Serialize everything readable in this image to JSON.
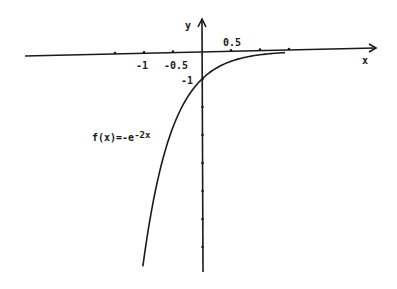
{
  "chart_data": {
    "type": "line",
    "title": "",
    "function_label": "f(x)=-e",
    "function_exponent": "-2x",
    "function_expr": "f(x) = -e^(-2x)",
    "xlabel": "x",
    "ylabel": "y",
    "x_tick_labels": [
      {
        "value": -1,
        "label": "-1"
      },
      {
        "value": -0.5,
        "label": "-0.5"
      },
      {
        "value": 0.5,
        "label": "0.5"
      }
    ],
    "x_ticks": [
      -1.5,
      -1,
      -0.5,
      0.5,
      1,
      1.5
    ],
    "y_tick_labels": [
      {
        "value": -1,
        "label": "-1"
      }
    ],
    "y_ticks": [
      -1,
      -2,
      -3,
      -4,
      -5,
      -6,
      -7
    ],
    "xlim": [
      -3,
      3
    ],
    "ylim": [
      -7.8,
      1.5
    ],
    "grid": false,
    "legend": "none",
    "series": [
      {
        "name": "f(x)=-e^(-2x)",
        "x": [
          -1.02,
          -1.0,
          -0.8,
          -0.6,
          -0.4,
          -0.2,
          0,
          0.2,
          0.4,
          0.6,
          0.8,
          1.0,
          1.2,
          1.43
        ],
        "values": [
          -7.69,
          -7.39,
          -4.95,
          -3.32,
          -2.23,
          -1.49,
          -1.0,
          -0.67,
          -0.45,
          -0.3,
          -0.2,
          -0.14,
          -0.09,
          -0.06
        ]
      }
    ],
    "annotations": [
      "f(x)=-e^-2x"
    ]
  },
  "axes": {
    "x_label": "x",
    "y_label": "y"
  }
}
